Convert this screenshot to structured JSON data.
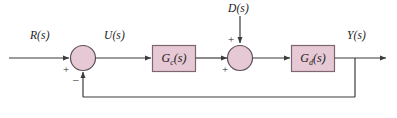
{
  "diagram": {
    "type": "control-block-diagram",
    "colors": {
      "block_fill": "#e6c9d5",
      "block_stroke": "#7d6670",
      "line": "#3b3b3b",
      "text": "#1a1a1a",
      "background": "#ffffff"
    }
  },
  "signals": {
    "reference": "R(s)",
    "control": "U(s)",
    "disturbance": "D(s)",
    "output": "Y(s)"
  },
  "blocks": [
    {
      "id": "controller",
      "label_main": "G",
      "label_sub": "c",
      "label_tail": "(s)",
      "label_full": "Gc(s)"
    },
    {
      "id": "plant",
      "label_main": "G",
      "label_sub": "d",
      "label_tail": "(s)",
      "label_full": "Gd(s)"
    }
  ],
  "summing_junctions": [
    {
      "id": "error-junction",
      "signs": {
        "input_left": "+",
        "input_bottom": "–"
      }
    },
    {
      "id": "disturbance-junction",
      "signs": {
        "input_top": "+",
        "input_left": "+"
      }
    }
  ]
}
